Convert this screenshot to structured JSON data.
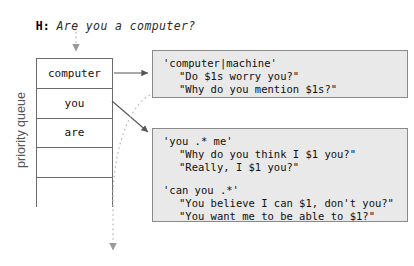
{
  "dialogue": {
    "speaker": "H:",
    "text": "Are you a computer?"
  },
  "queue": {
    "label": "priority queue",
    "cells": [
      {
        "text": "computer"
      },
      {
        "text": "you"
      },
      {
        "text": "are"
      },
      {
        "text": ""
      },
      {
        "text": ""
      }
    ]
  },
  "rule_boxes": [
    {
      "id": "rule-box-1",
      "groups": [
        {
          "pattern": "'computer|machine'",
          "responses": [
            "\"Do $1s worry you?\"",
            "\"Why do you mention $1s?\""
          ]
        }
      ]
    },
    {
      "id": "rule-box-2",
      "groups": [
        {
          "pattern": "'you .* me'",
          "responses": [
            "\"Why do you think I $1 you?\"",
            "\"Really, I $1 you?\""
          ]
        },
        {
          "pattern": "'can you .*'",
          "responses": [
            "\"You believe I can $1, don't you?\"",
            "\"You want me to be able to $1?\""
          ]
        }
      ]
    }
  ],
  "colors": {
    "box_fill": "#e9e9e9",
    "box_border": "#8a8a8a",
    "queue_border": "#6b6b6b",
    "solid_edge": "#555555",
    "dotted_edge": "#b5b5b5",
    "label_text": "#555555"
  }
}
